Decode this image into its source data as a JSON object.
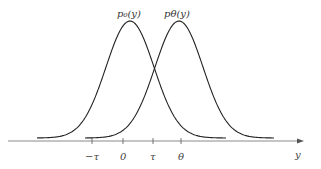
{
  "diagram": {
    "curves": [
      {
        "name": "p0",
        "label": "p₀(y)",
        "mean_px": 130
      },
      {
        "name": "ptheta",
        "label": "pθ(y)",
        "mean_px": 179
      }
    ],
    "axis": {
      "label": "y",
      "ticks": [
        {
          "label": "−τ",
          "x": 92
        },
        {
          "label": "0",
          "x": 123
        },
        {
          "label": "τ",
          "x": 153
        },
        {
          "label": "θ",
          "x": 181
        }
      ]
    },
    "colors": {
      "curve": "#222222",
      "axis": "#777777"
    }
  }
}
